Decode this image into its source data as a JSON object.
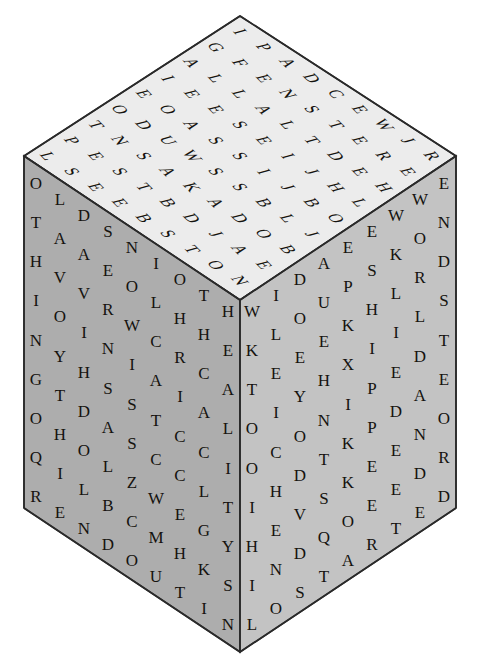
{
  "puzzle": {
    "title": "Letter Cube Word Search",
    "shape": "cube",
    "projection": "isometric",
    "grid_size": 9,
    "faces_visible": 3
  },
  "colors": {
    "background": "#ffffff",
    "top_face": "#ececec",
    "left_face": "#adadad",
    "right_face": "#c3c3c3",
    "edge_stroke": "#2a2a2a",
    "letter_fill": "#15130f"
  },
  "geometry": {
    "top_vertex": [
      240,
      16
    ],
    "left_vertex": [
      24,
      156
    ],
    "right_vertex": [
      456,
      156
    ],
    "front_vertex": [
      240,
      300
    ],
    "bottom_left": [
      24,
      508
    ],
    "bottom_right": [
      456,
      508
    ],
    "bottom_vertex": [
      240,
      652
    ]
  },
  "faces": {
    "top": {
      "name": "top-face",
      "fill": "#ececec",
      "rows": [
        [
          "I",
          "P",
          "A",
          "D",
          "C",
          "E",
          "W",
          "J",
          "R"
        ],
        [
          "G",
          "F",
          "E",
          "N",
          "S",
          "T",
          "E",
          "R",
          "E"
        ],
        [
          "A",
          "L",
          "L",
          "A",
          "L",
          "T",
          "D",
          "E",
          "H"
        ],
        [
          "I",
          "E",
          "E",
          "S",
          "E",
          "I",
          "J",
          "H",
          "L"
        ],
        [
          "E",
          "O",
          "A",
          "S",
          "S",
          "I",
          "J",
          "B",
          "O"
        ],
        [
          "O",
          "D",
          "U",
          "W",
          "S",
          "S",
          "B",
          "L",
          "J"
        ],
        [
          "T",
          "N",
          "S",
          "A",
          "K",
          "A",
          "D",
          "O",
          "B"
        ],
        [
          "P",
          "E",
          "S",
          "T",
          "B",
          "D",
          "J",
          "A",
          "E"
        ],
        [
          "L",
          "S",
          "E",
          "E",
          "B",
          "S",
          "T",
          "O",
          "N"
        ]
      ]
    },
    "left": {
      "name": "left-face",
      "fill": "#adadad",
      "rows": [
        [
          "O",
          "L",
          "D",
          "S",
          "N",
          "I",
          "O",
          "T",
          "H"
        ],
        [
          "T",
          "A",
          "A",
          "E",
          "O",
          "L",
          "H",
          "H",
          "E"
        ],
        [
          "H",
          "V",
          "V",
          "R",
          "W",
          "C",
          "R",
          "C",
          "A"
        ],
        [
          "I",
          "O",
          "I",
          "N",
          "I",
          "A",
          "I",
          "A",
          "L"
        ],
        [
          "N",
          "Y",
          "H",
          "S",
          "S",
          "T",
          "C",
          "C",
          "I"
        ],
        [
          "G",
          "T",
          "D",
          "A",
          "S",
          "C",
          "C",
          "L",
          "T"
        ],
        [
          "O",
          "H",
          "O",
          "L",
          "Z",
          "W",
          "E",
          "G",
          "Y"
        ],
        [
          "Q",
          "I",
          "L",
          "B",
          "C",
          "M",
          "H",
          "K",
          "S"
        ],
        [
          "R",
          "E",
          "N",
          "D",
          "O",
          "U",
          "T",
          "I",
          "N"
        ]
      ]
    },
    "right": {
      "name": "right-face",
      "fill": "#c3c3c3",
      "rows": [
        [
          "W",
          "I",
          "D",
          "A",
          "E",
          "E",
          "W",
          "W",
          "E"
        ],
        [
          "K",
          "L",
          "O",
          "U",
          "P",
          "S",
          "K",
          "O",
          "N"
        ],
        [
          "T",
          "E",
          "E",
          "E",
          "K",
          "H",
          "L",
          "R",
          "D"
        ],
        [
          "O",
          "I",
          "Y",
          "H",
          "X",
          "I",
          "I",
          "L",
          "S"
        ],
        [
          "O",
          "C",
          "O",
          "N",
          "I",
          "P",
          "E",
          "D",
          "T"
        ],
        [
          "I",
          "H",
          "D",
          "T",
          "K",
          "P",
          "D",
          "A",
          "E"
        ],
        [
          "H",
          "E",
          "V",
          "S",
          "K",
          "E",
          "E",
          "N",
          "O"
        ],
        [
          "I",
          "N",
          "D",
          "Q",
          "O",
          "E",
          "E",
          "D",
          "R"
        ],
        [
          "L",
          "O",
          "S",
          "T",
          "A",
          "R",
          "T",
          "E",
          "D"
        ]
      ]
    }
  },
  "hidden_words": {
    "left_edge_column": "OTHINGOQI",
    "right_edge_column": "WORLDAND"
  }
}
